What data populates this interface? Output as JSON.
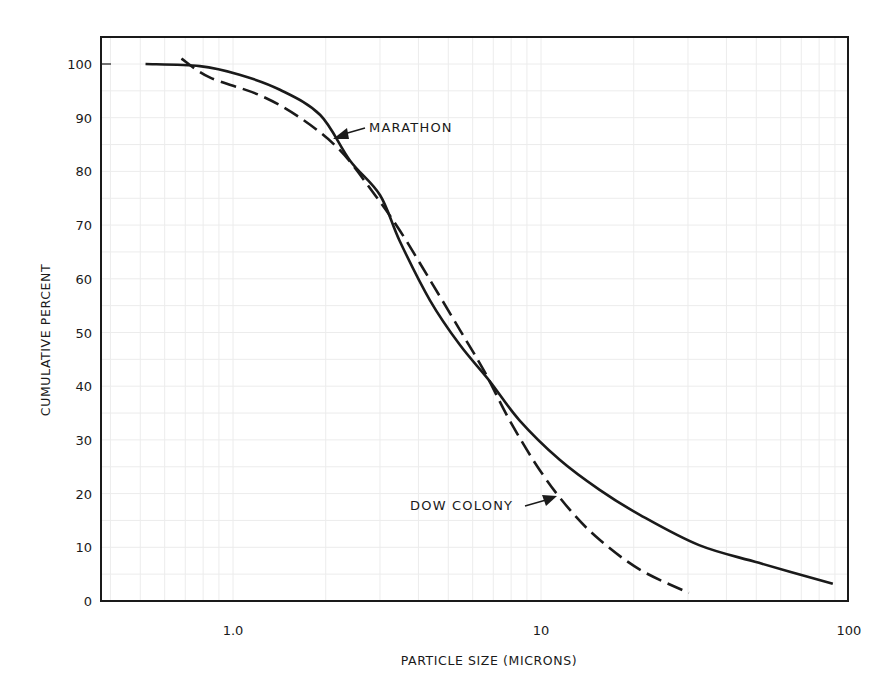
{
  "chart_data": {
    "type": "line",
    "title": "",
    "xlabel": "PARTICLE SIZE (MICRONS)",
    "ylabel": "CUMULATIVE PERCENT",
    "xscale": "log",
    "xlim": [
      0.37,
      100
    ],
    "ylim": [
      0,
      105
    ],
    "xticks": [
      1.0,
      10,
      100
    ],
    "xtick_labels": [
      "1.0",
      "10",
      "100"
    ],
    "yticks": [
      0,
      10,
      20,
      30,
      40,
      50,
      60,
      70,
      80,
      90,
      100
    ],
    "ytick_labels": [
      "0",
      "10",
      "20",
      "30",
      "40",
      "50",
      "60",
      "70",
      "80",
      "90",
      "100"
    ],
    "grid": "faint log-linear graph paper",
    "legend": "none (inline annotations)",
    "series": [
      {
        "name": "MARATHON",
        "style": "solid",
        "x": [
          0.52,
          0.78,
          1.05,
          1.42,
          1.92,
          2.4,
          3.0,
          3.48,
          4.36,
          5.45,
          6.8,
          8.5,
          11.5,
          15.5,
          21,
          32.6,
          51,
          88.6
        ],
        "y": [
          100,
          99.6,
          98,
          95.2,
          90.5,
          82,
          75.6,
          67,
          56,
          47.7,
          41,
          33.7,
          26.3,
          20.7,
          16,
          10.4,
          7.1,
          3.2
        ]
      },
      {
        "name": "DOW COLONY",
        "style": "dashed",
        "x": [
          0.68,
          0.84,
          1.22,
          1.65,
          2.22,
          2.89,
          3.48,
          4.36,
          5.45,
          6.57,
          7.9,
          9.9,
          12.4,
          15.5,
          21,
          30.2
        ],
        "y": [
          101,
          97.5,
          94.2,
          90,
          84,
          75.6,
          69,
          59.8,
          50.5,
          42.6,
          33.7,
          24.4,
          17,
          11.4,
          5.8,
          1.5
        ]
      }
    ],
    "annotations": [
      {
        "text": "MARATHON",
        "points_to_series": "MARATHON",
        "label_x": 2.8,
        "label_y": 88,
        "arrow_to": [
          2.1,
          86.5
        ]
      },
      {
        "text": "DOW COLONY",
        "points_to_series": "DOW COLONY",
        "label_x": 3.5,
        "label_y": 18,
        "arrow_to": [
          11.0,
          19.5
        ]
      }
    ]
  },
  "colors": {
    "ink": "#1a1a1a",
    "grid": "#ececec",
    "background": "#ffffff"
  }
}
